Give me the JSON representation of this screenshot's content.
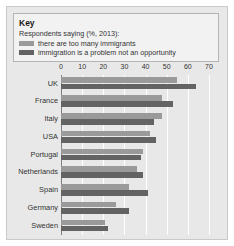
{
  "key": {
    "title": "Key",
    "subtitle": "Respondents saying (%, 2013):",
    "series": [
      {
        "name": "there are too many immigrants",
        "color": "#9a9a9a"
      },
      {
        "name": "immigration is a problem not an opportunity",
        "color": "#636363"
      }
    ]
  },
  "chart_data": {
    "type": "bar",
    "orientation": "horizontal",
    "title": "Respondents saying (%, 2013):",
    "xlabel": "",
    "ylabel": "",
    "xlim": [
      0,
      70
    ],
    "xticks": [
      0,
      10,
      20,
      30,
      40,
      50,
      60,
      70
    ],
    "grid": true,
    "legend_position": "top",
    "categories": [
      "UK",
      "France",
      "Italy",
      "USA",
      "Portugal",
      "Netherlands",
      "Spain",
      "Germany",
      "Sweden"
    ],
    "series": [
      {
        "name": "there are too many immigrants",
        "color": "#9a9a9a",
        "values": [
          55,
          48,
          48,
          42,
          39,
          36,
          32,
          26,
          21
        ]
      },
      {
        "name": "immigration is a problem not an opportunity",
        "color": "#636363",
        "values": [
          64,
          53,
          44,
          45,
          38,
          39,
          41,
          32,
          22
        ]
      }
    ]
  }
}
